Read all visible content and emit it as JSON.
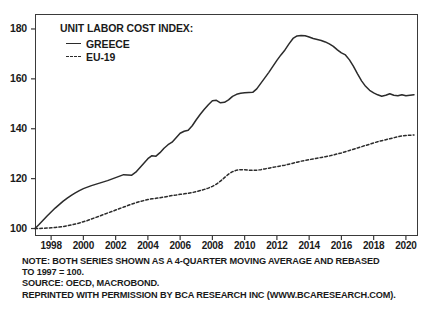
{
  "legend": {
    "title": "UNIT LABOR COST INDEX:",
    "items": [
      {
        "label": "GREECE",
        "style": "solid"
      },
      {
        "label": "EU-19",
        "style": "dashed"
      }
    ]
  },
  "notes": [
    "NOTE: BOTH SERIES SHOWN AS A 4-QUARTER MOVING AVERAGE AND REBASED",
    "TO 1997 = 100.",
    "SOURCE: OECD, MACROBOND.",
    "REPRINTED WITH PERMISSION BY BCA RESEARCH INC (WWW.BCARESEARCH.COM)."
  ],
  "colors": {
    "line": "#2b2b2b",
    "frame": "#3a3a3a",
    "background": "#ffffff"
  },
  "chart_data": {
    "type": "line",
    "title": "UNIT LABOR COST INDEX:",
    "xlabel": "",
    "ylabel": "",
    "xlim": [
      1997.0,
      2020.75
    ],
    "ylim": [
      97,
      186
    ],
    "yticks": [
      100,
      120,
      140,
      160,
      180
    ],
    "xticks": [
      1998,
      2000,
      2002,
      2004,
      2006,
      2008,
      2010,
      2012,
      2014,
      2016,
      2018,
      2020
    ],
    "grid": false,
    "legend_position": "top-left",
    "series": [
      {
        "name": "GREECE",
        "style": "solid",
        "x": [
          1997.0,
          1997.25,
          1997.5,
          1997.75,
          1998.0,
          1998.25,
          1998.5,
          1998.75,
          1999.0,
          1999.25,
          1999.5,
          1999.75,
          2000.0,
          2000.25,
          2000.5,
          2000.75,
          2001.0,
          2001.25,
          2001.5,
          2001.75,
          2002.0,
          2002.25,
          2002.5,
          2002.75,
          2003.0,
          2003.25,
          2003.5,
          2003.75,
          2004.0,
          2004.25,
          2004.5,
          2004.75,
          2005.0,
          2005.25,
          2005.5,
          2005.75,
          2006.0,
          2006.25,
          2006.5,
          2006.75,
          2007.0,
          2007.25,
          2007.5,
          2007.75,
          2008.0,
          2008.25,
          2008.5,
          2008.75,
          2009.0,
          2009.25,
          2009.5,
          2009.75,
          2010.0,
          2010.25,
          2010.5,
          2010.75,
          2011.0,
          2011.25,
          2011.5,
          2011.75,
          2012.0,
          2012.25,
          2012.5,
          2012.75,
          2013.0,
          2013.25,
          2013.5,
          2013.75,
          2014.0,
          2014.25,
          2014.5,
          2014.75,
          2015.0,
          2015.25,
          2015.5,
          2015.75,
          2016.0,
          2016.25,
          2016.5,
          2016.75,
          2017.0,
          2017.25,
          2017.5,
          2017.75,
          2018.0,
          2018.25,
          2018.5,
          2018.75,
          2019.0,
          2019.25,
          2019.5,
          2019.75,
          2020.0,
          2020.25,
          2020.5
        ],
        "y": [
          100.0,
          101.6,
          103.3,
          105.0,
          106.6,
          108.2,
          109.6,
          111.0,
          112.2,
          113.3,
          114.3,
          115.2,
          116.0,
          116.6,
          117.2,
          117.7,
          118.2,
          118.7,
          119.2,
          119.8,
          120.4,
          121.0,
          121.6,
          121.5,
          121.4,
          122.6,
          124.4,
          126.2,
          128.0,
          129.2,
          129.0,
          130.4,
          132.2,
          133.6,
          134.6,
          136.4,
          138.2,
          139.0,
          139.4,
          141.2,
          143.6,
          145.8,
          147.8,
          149.6,
          151.2,
          151.4,
          150.4,
          150.6,
          151.6,
          153.0,
          153.8,
          154.2,
          154.4,
          154.5,
          154.6,
          156.0,
          158.2,
          160.4,
          162.6,
          165.0,
          167.4,
          169.6,
          171.6,
          174.0,
          176.2,
          177.2,
          177.4,
          177.3,
          176.8,
          176.2,
          175.8,
          175.4,
          174.8,
          174.0,
          173.0,
          171.6,
          170.4,
          169.6,
          167.6,
          165.0,
          162.0,
          159.2,
          157.0,
          155.4,
          154.4,
          153.6,
          153.0,
          153.4,
          154.0,
          153.4,
          153.2,
          153.6,
          153.2,
          153.4,
          153.6
        ]
      },
      {
        "name": "EU-19",
        "style": "dashed",
        "x": [
          1997.0,
          1997.25,
          1997.5,
          1997.75,
          1998.0,
          1998.25,
          1998.5,
          1998.75,
          1999.0,
          1999.25,
          1999.5,
          1999.75,
          2000.0,
          2000.25,
          2000.5,
          2000.75,
          2001.0,
          2001.25,
          2001.5,
          2001.75,
          2002.0,
          2002.25,
          2002.5,
          2002.75,
          2003.0,
          2003.25,
          2003.5,
          2003.75,
          2004.0,
          2004.25,
          2004.5,
          2004.75,
          2005.0,
          2005.25,
          2005.5,
          2005.75,
          2006.0,
          2006.25,
          2006.5,
          2006.75,
          2007.0,
          2007.25,
          2007.5,
          2007.75,
          2008.0,
          2008.25,
          2008.5,
          2008.75,
          2009.0,
          2009.25,
          2009.5,
          2009.75,
          2010.0,
          2010.25,
          2010.5,
          2010.75,
          2011.0,
          2011.25,
          2011.5,
          2011.75,
          2012.0,
          2012.25,
          2012.5,
          2012.75,
          2013.0,
          2013.25,
          2013.5,
          2013.75,
          2014.0,
          2014.25,
          2014.5,
          2014.75,
          2015.0,
          2015.25,
          2015.5,
          2015.75,
          2016.0,
          2016.25,
          2016.5,
          2016.75,
          2017.0,
          2017.25,
          2017.5,
          2017.75,
          2018.0,
          2018.25,
          2018.5,
          2018.75,
          2019.0,
          2019.25,
          2019.5,
          2019.75,
          2020.0,
          2020.25,
          2020.5
        ],
        "y": [
          100.0,
          100.0,
          100.1,
          100.2,
          100.3,
          100.4,
          100.6,
          100.8,
          101.1,
          101.4,
          101.8,
          102.2,
          102.7,
          103.2,
          103.8,
          104.4,
          105.0,
          105.6,
          106.2,
          106.8,
          107.4,
          108.0,
          108.6,
          109.2,
          109.8,
          110.3,
          110.8,
          111.2,
          111.6,
          111.9,
          112.1,
          112.3,
          112.6,
          112.9,
          113.2,
          113.4,
          113.7,
          113.9,
          114.1,
          114.4,
          114.8,
          115.2,
          115.7,
          116.2,
          116.9,
          117.8,
          119.0,
          120.4,
          121.8,
          122.8,
          123.4,
          123.6,
          123.6,
          123.4,
          123.3,
          123.4,
          123.6,
          123.9,
          124.2,
          124.5,
          124.8,
          125.1,
          125.4,
          125.8,
          126.2,
          126.6,
          127.0,
          127.3,
          127.6,
          127.9,
          128.2,
          128.5,
          128.8,
          129.1,
          129.5,
          129.9,
          130.3,
          130.8,
          131.3,
          131.8,
          132.3,
          132.8,
          133.3,
          133.8,
          134.3,
          134.8,
          135.2,
          135.6,
          136.0,
          136.4,
          136.8,
          137.1,
          137.3,
          137.4,
          137.5
        ]
      }
    ]
  }
}
